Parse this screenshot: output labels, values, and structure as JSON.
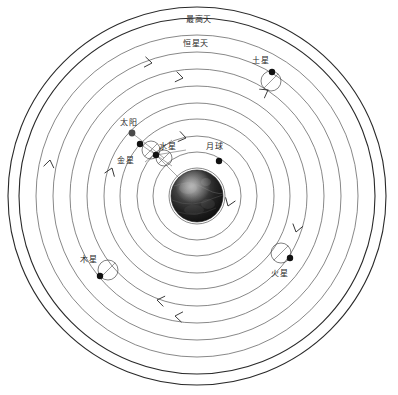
{
  "diagram": {
    "type": "geocentric-cosmology-diagram",
    "center_body": "earth-globe",
    "background_color": "#ffffff",
    "line_color": "#555555",
    "emphasis_line_color": "#2a2a2a",
    "marker_color": "#111111",
    "text_color": "#2b2b2b",
    "center": {
      "x": 197,
      "y": 196
    },
    "orbit_count": 11,
    "orbit_radii": [
      28,
      44,
      60,
      77,
      93,
      110,
      127,
      144,
      161,
      178,
      189
    ],
    "emphasized_orbits": [
      9,
      10
    ],
    "direction": "counterclockwise"
  },
  "labels": {
    "outermost_sphere": "最高天",
    "fixed_stars_sphere": "恒星天",
    "saturn": "土星",
    "jupiter": "木星",
    "mars": "火星",
    "sun": "太阳",
    "venus": "金星",
    "mercury": "水星",
    "moon": "月球"
  },
  "bodies": [
    {
      "id": "saturn",
      "label": "土星",
      "marker": {
        "x": 272,
        "y": 72
      },
      "epicycle": {
        "cx": 271,
        "cy": 81,
        "r": 10
      },
      "label_pos": {
        "x": 252,
        "y": 57
      }
    },
    {
      "id": "jupiter",
      "label": "木星",
      "marker": {
        "x": 100,
        "y": 276
      },
      "epicycle": {
        "cx": 108,
        "cy": 270,
        "r": 10
      },
      "label_pos": {
        "x": 80,
        "y": 256
      }
    },
    {
      "id": "mars",
      "label": "火星",
      "marker": {
        "x": 290,
        "y": 258
      },
      "epicycle": {
        "cx": 281,
        "cy": 253,
        "r": 10
      },
      "label_pos": {
        "x": 271,
        "y": 270
      }
    },
    {
      "id": "sun",
      "label": "太阳",
      "marker": {
        "x": 132,
        "y": 133
      },
      "epicycle": null,
      "label_pos": {
        "x": 120,
        "y": 119
      }
    },
    {
      "id": "venus",
      "label": "金星",
      "marker": {
        "x": 140,
        "y": 144
      },
      "epicycle": {
        "cx": 151,
        "cy": 150,
        "r": 9
      },
      "label_pos": {
        "x": 117,
        "y": 157
      }
    },
    {
      "id": "mercury",
      "label": "水星",
      "marker": {
        "x": 156,
        "y": 155
      },
      "epicycle": {
        "cx": 164,
        "cy": 158,
        "r": 8
      },
      "label_pos": {
        "x": 159,
        "y": 143
      }
    },
    {
      "id": "moon",
      "label": "月球",
      "marker": {
        "x": 219,
        "y": 161
      },
      "epicycle": null,
      "label_pos": {
        "x": 206,
        "y": 143
      }
    }
  ],
  "sphere_labels": [
    {
      "id": "outermost",
      "text": "最高天",
      "x": 186,
      "y": 16
    },
    {
      "id": "fixed-stars",
      "text": "恒星天",
      "x": 183,
      "y": 40
    }
  ],
  "direction_arrows": [
    {
      "id": "arrow-top",
      "x": 152,
      "y": 63,
      "angle": 188
    },
    {
      "id": "arrow-upper-mid",
      "x": 183,
      "y": 78,
      "angle": 190
    },
    {
      "id": "arrow-inner-top",
      "x": 186,
      "y": 138,
      "angle": 192
    },
    {
      "id": "arrow-left-upper",
      "x": 50,
      "y": 160,
      "angle": 100
    },
    {
      "id": "arrow-left-lower",
      "x": 112,
      "y": 168,
      "angle": 110
    },
    {
      "id": "arrow-bottom-left",
      "x": 157,
      "y": 300,
      "angle": 10
    },
    {
      "id": "arrow-bottom-mid",
      "x": 175,
      "y": 316,
      "angle": 8
    },
    {
      "id": "arrow-right",
      "x": 296,
      "y": 232,
      "angle": 285
    },
    {
      "id": "arrow-right-inner",
      "x": 228,
      "y": 206,
      "angle": 290
    },
    {
      "id": "arrow-saturn-epi",
      "x": 268,
      "y": 90,
      "angle": 150
    }
  ]
}
